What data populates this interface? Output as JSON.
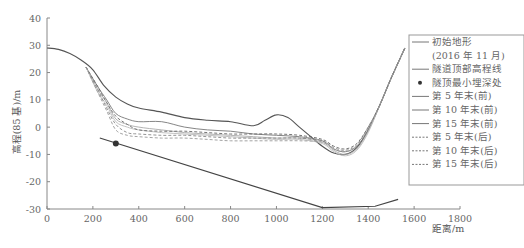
{
  "chart_data": {
    "type": "line",
    "title": "",
    "xlabel": "距离/m",
    "ylabel": "高程(85 基)/m",
    "xlim": [
      0,
      1800
    ],
    "ylim": [
      -30,
      40
    ],
    "xticks": [
      0,
      200,
      400,
      600,
      800,
      1000,
      1200,
      1400,
      1600,
      1800
    ],
    "yticks": [
      -30,
      -20,
      -10,
      0,
      10,
      20,
      30,
      40
    ],
    "grid": false,
    "legend_position": "right",
    "series": [
      {
        "name": "初始地形(2016 年 11 月)",
        "style": "solid",
        "color": "#555555",
        "x": [
          0,
          50,
          100,
          150,
          200,
          250,
          300,
          350,
          400,
          500,
          600,
          700,
          800,
          900,
          950,
          1000,
          1050,
          1100,
          1150,
          1200,
          1250,
          1300,
          1350,
          1400,
          1450,
          1500,
          1560
        ],
        "y": [
          29,
          28.5,
          27,
          24.5,
          21,
          15,
          11,
          8.5,
          7,
          5.5,
          3.5,
          2.5,
          2,
          0.5,
          2.5,
          4.5,
          3.5,
          0,
          -3.5,
          -7,
          -9.5,
          -10,
          -7.5,
          -1,
          8,
          18,
          29
        ]
      },
      {
        "name": "隧道顶部高程线",
        "style": "solid",
        "color": "#444444",
        "x": [
          230,
          1200,
          1430,
          1530
        ],
        "y": [
          -4,
          -29.5,
          -29,
          -26.5
        ]
      },
      {
        "name": "隧顶最小埋深处",
        "style": "marker",
        "color": "#333333",
        "x": [
          300
        ],
        "y": [
          -6
        ]
      },
      {
        "name": "第 5 年末(前)",
        "style": "solid",
        "color": "#777777",
        "x": [
          170,
          220,
          260,
          300,
          350,
          400,
          500,
          600,
          700,
          800,
          900,
          1000,
          1100,
          1200,
          1250,
          1300,
          1350,
          1400,
          1450,
          1500,
          1560
        ],
        "y": [
          22,
          15,
          10,
          5,
          3,
          2,
          2,
          0,
          -1,
          -1.5,
          -2.5,
          -3,
          -3.5,
          -5,
          -8,
          -9,
          -7,
          -1,
          8,
          18,
          29
        ]
      },
      {
        "name": "第 10 年末(前)",
        "style": "solid",
        "color": "#aaaaaa",
        "x": [
          170,
          220,
          260,
          300,
          350,
          400,
          500,
          600,
          700,
          800,
          900,
          1000,
          1100,
          1200,
          1250,
          1300,
          1350,
          1400,
          1450,
          1500,
          1560
        ],
        "y": [
          22,
          14,
          9,
          3,
          1,
          0,
          -1,
          -2,
          -2.5,
          -3,
          -3.5,
          -4,
          -4,
          -5.5,
          -8.5,
          -10,
          -8,
          -1.5,
          8,
          18,
          29
        ]
      },
      {
        "name": "第 15 年末(前)",
        "style": "solid",
        "color": "#bbbbbb",
        "x": [
          170,
          220,
          260,
          300,
          350,
          400,
          500,
          600,
          700,
          800,
          900,
          1000,
          1100,
          1200,
          1250,
          1300,
          1350,
          1400,
          1450,
          1500,
          1560
        ],
        "y": [
          22,
          13,
          8,
          2,
          0,
          -1,
          -2,
          -2.5,
          -3,
          -3.5,
          -4,
          -4.5,
          -4.5,
          -6,
          -9,
          -10.5,
          -8.5,
          -2,
          8,
          18,
          29
        ]
      },
      {
        "name": "第 5 年末(后)",
        "style": "dashed",
        "color": "#666666",
        "x": [
          170,
          220,
          260,
          300,
          350,
          400,
          500,
          600,
          700,
          800,
          900,
          1000,
          1100,
          1200,
          1250,
          1300,
          1350,
          1400,
          1450,
          1500,
          1560
        ],
        "y": [
          22,
          15,
          9,
          4,
          1,
          -1,
          -1.5,
          -1.5,
          -2,
          -2.5,
          -2.5,
          -2.5,
          -3,
          -4.5,
          -7,
          -8,
          -6,
          0,
          8,
          18,
          29
        ]
      },
      {
        "name": "第 10 年末(后)",
        "style": "dashed",
        "color": "#888888",
        "x": [
          170,
          220,
          260,
          300,
          350,
          400,
          500,
          600,
          700,
          800,
          900,
          1000,
          1100,
          1200,
          1250,
          1300,
          1350,
          1400,
          1450,
          1500,
          1560
        ],
        "y": [
          22,
          14,
          7,
          1,
          -2,
          -2.5,
          -3,
          -3,
          -3.5,
          -4,
          -4,
          -4,
          -4,
          -5,
          -7.5,
          -8.5,
          -6.5,
          0,
          8,
          18,
          29
        ]
      },
      {
        "name": "第 15 年末(后)",
        "style": "dashed",
        "color": "#999999",
        "x": [
          170,
          220,
          260,
          300,
          350,
          400,
          500,
          600,
          700,
          800,
          900,
          1000,
          1100,
          1200,
          1250,
          1300,
          1350,
          1400,
          1450,
          1500,
          1560
        ],
        "y": [
          22,
          13,
          6,
          -1,
          -3,
          -3.5,
          -4,
          -4,
          -4.5,
          -5,
          -5,
          -5,
          -5,
          -5.5,
          -8,
          -9,
          -7,
          -0.5,
          8,
          18,
          29
        ]
      }
    ]
  },
  "legend": {
    "items": [
      {
        "label": "初始地形",
        "style": "solid"
      },
      {
        "label": "(2016 年 11 月)",
        "style": "none"
      },
      {
        "label": "隧道顶部高程线",
        "style": "solid"
      },
      {
        "label": "隧顶最小埋深处",
        "style": "marker"
      },
      {
        "label": "第 5 年末(前)",
        "style": "solid"
      },
      {
        "label": "第 10 年末(前)",
        "style": "solid"
      },
      {
        "label": "第 15 年末(前)",
        "style": "solid"
      },
      {
        "label": "第 5 年末(后)",
        "style": "dashed"
      },
      {
        "label": "第 10 年末(后)",
        "style": "dashed"
      },
      {
        "label": "第 15 年末(后)",
        "style": "dashed"
      }
    ]
  },
  "axes": {
    "xlabel": "距离/m",
    "ylabel": "高程(85 基)/m"
  }
}
